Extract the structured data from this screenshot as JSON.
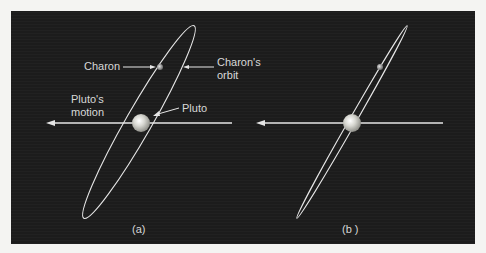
{
  "figure": {
    "background_color": "#1c1c1c",
    "line_color": "#e6e6e6",
    "panels": [
      {
        "id": "a",
        "caption": "(a)",
        "labels": {
          "charon": "Charon",
          "charon_orbit_line1": "Charon's",
          "charon_orbit_line2": "orbit",
          "pluto_motion_line1": "Pluto's",
          "pluto_motion_line2": "motion",
          "pluto": "Pluto"
        }
      },
      {
        "id": "b",
        "caption": "(b )"
      }
    ]
  }
}
